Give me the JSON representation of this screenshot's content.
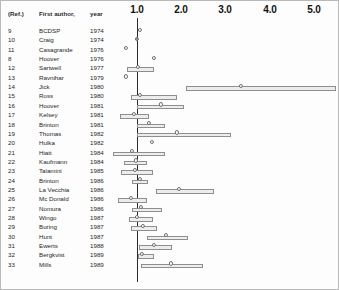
{
  "figure": {
    "type": "forest-plot",
    "width": 339,
    "height": 290
  },
  "headers": {
    "ref": "(Ref.)",
    "author": "First author,",
    "year": "year"
  },
  "axis": {
    "ticks": [
      "1.0",
      "2.0",
      "3.0",
      "4.0",
      "5.0"
    ],
    "tick_values": [
      1.0,
      2.0,
      3.0,
      4.0,
      5.0
    ],
    "tick_x_px": [
      136,
      180,
      224,
      269,
      313
    ],
    "reference_value": 1.0,
    "reference_x_px": 136,
    "px_per_unit": 44.25,
    "xlabel": "",
    "grid": false
  },
  "chart_data": {
    "type": "forest",
    "title": "",
    "xlabel": "",
    "ylabel": "",
    "xlim": [
      0.2,
      5.4
    ],
    "grid": false,
    "legend": "none",
    "reference_line": 1.0,
    "columns": [
      "(Ref.)",
      "First author,",
      "year",
      "relative risk",
      "95% CI low",
      "95% CI high"
    ],
    "rows": [
      {
        "ref": "9",
        "author": "BCDSP",
        "year": "1974",
        "est_x_px": 139,
        "ci": null,
        "filled": false
      },
      {
        "ref": "10",
        "author": "Craig",
        "year": "1974",
        "est_x_px": 136,
        "ci": null,
        "filled": true
      },
      {
        "ref": "11",
        "author": "Casagrande",
        "year": "1976",
        "est_x_px": 125,
        "ci": null,
        "filled": false
      },
      {
        "ref": "8",
        "author": "Hoover",
        "year": "1976",
        "est_x_px": 153,
        "ci": null,
        "filled": false
      },
      {
        "ref": "12",
        "author": "Sartwell",
        "year": "1977",
        "est_x_px": 137,
        "ci": [
          126,
          153
        ],
        "filled": false
      },
      {
        "ref": "13",
        "author": "Ravnihar",
        "year": "1979",
        "est_x_px": 125,
        "ci": null,
        "filled": false
      },
      {
        "ref": "14",
        "author": "Jick",
        "year": "1980",
        "est_x_px": 240,
        "ci": [
          185,
          335
        ],
        "filled": false
      },
      {
        "ref": "15",
        "author": "Ross",
        "year": "1980",
        "est_x_px": 139,
        "ci": [
          130,
          176
        ],
        "filled": false
      },
      {
        "ref": "16",
        "author": "Hoover",
        "year": "1981",
        "est_x_px": 160,
        "ci": [
          136,
          183
        ],
        "filled": false
      },
      {
        "ref": "17",
        "author": "Kelsey",
        "year": "1981",
        "est_x_px": 133,
        "ci": [
          119,
          148
        ],
        "filled": false
      },
      {
        "ref": "18",
        "author": "Brinton",
        "year": "1981",
        "est_x_px": 148,
        "ci": [
          136,
          164
        ],
        "filled": false
      },
      {
        "ref": "19",
        "author": "Thomas",
        "year": "1982",
        "est_x_px": 176,
        "ci": [
          136,
          230
        ],
        "filled": false
      },
      {
        "ref": "20",
        "author": "Hulka",
        "year": "1982",
        "est_x_px": 151,
        "ci": null,
        "filled": false
      },
      {
        "ref": "21",
        "author": "Hiatt",
        "year": "1984",
        "est_x_px": 131,
        "ci": [
          112,
          164
        ],
        "filled": false
      },
      {
        "ref": "22",
        "author": "Kaufmann",
        "year": "1984",
        "est_x_px": 135,
        "ci": [
          123,
          146
        ],
        "filled": false
      },
      {
        "ref": "23",
        "author": "Talamini",
        "year": "1985",
        "est_x_px": 134,
        "ci": [
          120,
          152
        ],
        "filled": false
      },
      {
        "ref": "24",
        "author": "Brinton",
        "year": "1986",
        "est_x_px": 139,
        "ci": [
          131,
          147
        ],
        "filled": false
      },
      {
        "ref": "25",
        "author": "La Vecchia",
        "year": "1986",
        "est_x_px": 178,
        "ci": [
          155,
          213
        ],
        "filled": false
      },
      {
        "ref": "26",
        "author": "Mc Donald",
        "year": "1986",
        "est_x_px": 130,
        "ci": [
          117,
          146
        ],
        "filled": false
      },
      {
        "ref": "27",
        "author": "Nomura",
        "year": "1986",
        "est_x_px": 140,
        "ci": [
          131,
          161
        ],
        "filled": false
      },
      {
        "ref": "28",
        "author": "Wingo",
        "year": "1987",
        "est_x_px": 136,
        "ci": [
          128,
          152
        ],
        "filled": false
      },
      {
        "ref": "29",
        "author": "Buring",
        "year": "1987",
        "est_x_px": 142,
        "ci": [
          130,
          156
        ],
        "filled": false
      },
      {
        "ref": "30",
        "author": "Hunt",
        "year": "1987",
        "est_x_px": 165,
        "ci": [
          146,
          187
        ],
        "filled": false
      },
      {
        "ref": "31",
        "author": "Ewerts",
        "year": "1988",
        "est_x_px": 153,
        "ci": [
          138,
          171
        ],
        "filled": false
      },
      {
        "ref": "32",
        "author": "Bergkvist",
        "year": "1989",
        "est_x_px": 141,
        "ci": [
          137,
          153
        ],
        "filled": false
      },
      {
        "ref": "33",
        "author": "Mills",
        "year": "1989",
        "est_x_px": 170,
        "ci": [
          140,
          202
        ],
        "filled": false
      }
    ]
  }
}
